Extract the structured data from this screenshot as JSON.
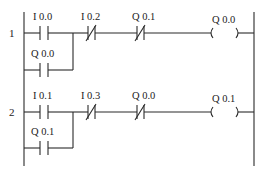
{
  "diagram": {
    "type": "ladder-logic",
    "rungs": [
      {
        "number": "1",
        "main_contacts": [
          {
            "label": "I 0.0",
            "type": "NO"
          },
          {
            "label": "I 0.2",
            "type": "NC"
          },
          {
            "label": "Q 0.1",
            "type": "NC"
          }
        ],
        "parallel_contact": {
          "label": "Q 0.0",
          "type": "NO"
        },
        "coil": {
          "label": "Q 0.0"
        }
      },
      {
        "number": "2",
        "main_contacts": [
          {
            "label": "I 0.1",
            "type": "NO"
          },
          {
            "label": "I 0.3",
            "type": "NC"
          },
          {
            "label": "Q 0.0",
            "type": "NC"
          }
        ],
        "parallel_contact": {
          "label": "Q 0.1",
          "type": "NO"
        },
        "coil": {
          "label": "Q 0.1"
        }
      }
    ]
  }
}
